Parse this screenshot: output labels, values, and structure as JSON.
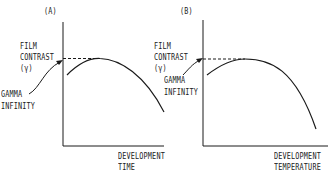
{
  "panels": [
    {
      "id": "A",
      "label": "(A)",
      "y_label_lines": [
        "FILM",
        "CONTRAST",
        "(γ)"
      ],
      "annotation_lines": [
        "GAMMA",
        "INFINITY"
      ],
      "x_label_lines": [
        "DEVELOPMENT",
        "TIME"
      ]
    },
    {
      "id": "B",
      "label": "(B)",
      "y_label_lines": [
        "FILM",
        "CONTRAST",
        "(γ)"
      ],
      "annotation_lines": [
        "GAMMA",
        "INFINITY"
      ],
      "x_label_lines": [
        "DEVELOPMENT",
        "TEMPERATURE"
      ]
    }
  ],
  "colors": {
    "ink": "#1a1a1a",
    "background": "#ffffff"
  }
}
